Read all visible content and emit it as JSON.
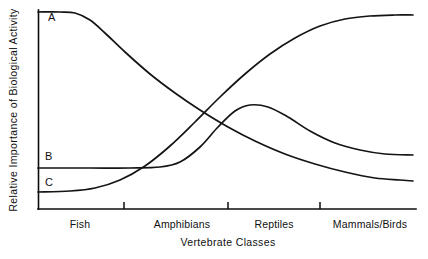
{
  "chart_data": {
    "type": "line",
    "title": "",
    "xlabel": "Vertebrate Classes",
    "ylabel": "Relative Importance of Biological Activity",
    "grid": false,
    "legend_position": "inline-curve-labels",
    "x_tick_labels": [
      "Fish",
      "Amphibians",
      "Reptiles",
      "Mammals/Birds"
    ],
    "x_tick_label_positions": [
      80,
      182,
      274,
      370
    ],
    "x_divider_ticks": [
      124,
      228,
      320
    ],
    "axis_ranges": {
      "x_pixel_range": [
        38,
        415
      ],
      "y_pixel_range": [
        209,
        10
      ],
      "x_units": "categorical-ordinal",
      "y_units": "relative (unlabeled)"
    },
    "series": [
      {
        "name": "A",
        "label": "A",
        "label_x": 48,
        "label_y": 21,
        "description": "High at Fish, declines steeply through Amphibians and Reptiles, low at Mammals/Birds",
        "points": [
          {
            "x": 38,
            "y": 12
          },
          {
            "x": 60,
            "y": 12
          },
          {
            "x": 75,
            "y": 13
          },
          {
            "x": 90,
            "y": 20
          },
          {
            "x": 105,
            "y": 33
          },
          {
            "x": 125,
            "y": 52
          },
          {
            "x": 150,
            "y": 74
          },
          {
            "x": 175,
            "y": 93
          },
          {
            "x": 200,
            "y": 110
          },
          {
            "x": 228,
            "y": 127
          },
          {
            "x": 255,
            "y": 141
          },
          {
            "x": 285,
            "y": 154
          },
          {
            "x": 315,
            "y": 164
          },
          {
            "x": 345,
            "y": 172
          },
          {
            "x": 375,
            "y": 178
          },
          {
            "x": 400,
            "y": 180
          },
          {
            "x": 413,
            "y": 181
          }
        ]
      },
      {
        "name": "B",
        "label": "B",
        "label_x": 45,
        "label_y": 160,
        "description": "Flat and low through Fish and Amphibians, rises to a broad peak near Reptiles, then declines moderately",
        "points": [
          {
            "x": 38,
            "y": 168
          },
          {
            "x": 90,
            "y": 168
          },
          {
            "x": 130,
            "y": 168
          },
          {
            "x": 160,
            "y": 167
          },
          {
            "x": 180,
            "y": 162
          },
          {
            "x": 200,
            "y": 147
          },
          {
            "x": 218,
            "y": 127
          },
          {
            "x": 235,
            "y": 111
          },
          {
            "x": 250,
            "y": 105
          },
          {
            "x": 268,
            "y": 107
          },
          {
            "x": 288,
            "y": 117
          },
          {
            "x": 310,
            "y": 131
          },
          {
            "x": 335,
            "y": 143
          },
          {
            "x": 360,
            "y": 150
          },
          {
            "x": 385,
            "y": 154
          },
          {
            "x": 413,
            "y": 155
          }
        ]
      },
      {
        "name": "C",
        "label": "C",
        "label_x": 45,
        "label_y": 186,
        "description": "Low at Fish, rises sharply through Amphibians and Reptiles, plateaus high at Mammals/Birds",
        "points": [
          {
            "x": 38,
            "y": 192
          },
          {
            "x": 70,
            "y": 191
          },
          {
            "x": 95,
            "y": 188
          },
          {
            "x": 120,
            "y": 180
          },
          {
            "x": 145,
            "y": 166
          },
          {
            "x": 170,
            "y": 146
          },
          {
            "x": 195,
            "y": 122
          },
          {
            "x": 220,
            "y": 97
          },
          {
            "x": 245,
            "y": 74
          },
          {
            "x": 270,
            "y": 54
          },
          {
            "x": 295,
            "y": 38
          },
          {
            "x": 320,
            "y": 26
          },
          {
            "x": 345,
            "y": 19
          },
          {
            "x": 370,
            "y": 16
          },
          {
            "x": 395,
            "y": 15
          },
          {
            "x": 413,
            "y": 15
          }
        ]
      }
    ]
  },
  "colors": {
    "curve_stroke": "#141414",
    "axis_stroke": "#0d0d0d",
    "text": "#111111",
    "background": "#ffffff"
  }
}
